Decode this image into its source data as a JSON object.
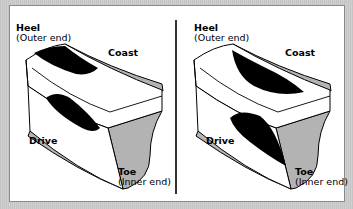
{
  "figure": {
    "panels": [
      {
        "id": "left",
        "heel_label": "Heel",
        "heel_sub": "(Outer end)",
        "coast_label": "Coast",
        "drive_label": "Drive",
        "toe_label": "Toe",
        "toe_sub": "(Inner end)",
        "contact_pattern": "heel-coast and heel-drive"
      },
      {
        "id": "right",
        "heel_label": "Heel",
        "heel_sub": "(Outer end)",
        "coast_label": "Coast",
        "drive_label": "Drive",
        "toe_label": "Toe",
        "toe_sub": "(Inner end)",
        "contact_pattern": "toe-coast and toe-drive"
      }
    ],
    "colors": {
      "frame": "#c9c9c9",
      "panel": "#ffffff",
      "tooth_face": "#ffffff",
      "tooth_side": "#b3b3b3",
      "contact": "#000000",
      "outline": "#000000"
    }
  }
}
